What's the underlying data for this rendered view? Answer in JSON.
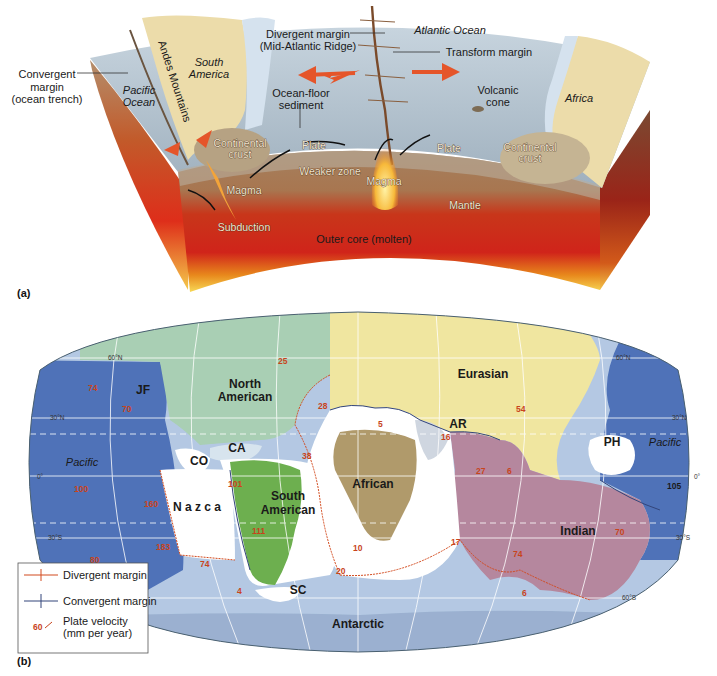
{
  "panel_a": {
    "tag": "(a)",
    "labels": {
      "convergent_margin": [
        "Convergent",
        "margin",
        "(ocean trench)"
      ],
      "pacific_ocean": [
        "Pacific",
        "Ocean"
      ],
      "andes": "Andes Mountains",
      "south_america": [
        "South",
        "America"
      ],
      "divergent_margin": [
        "Divergent margin",
        "(Mid-Atlantic Ridge)"
      ],
      "atlantic_ocean": "Atlantic Ocean",
      "transform_margin": "Transform margin",
      "ocean_floor_sediment": [
        "Ocean-floor",
        "sediment"
      ],
      "volcanic_cone": [
        "Volcanic",
        "cone"
      ],
      "africa": "Africa",
      "continental_crust_left": [
        "Continental",
        "crust"
      ],
      "continental_crust_right": [
        "Continental",
        "crust"
      ],
      "plate_left": "Plate",
      "plate_right": "Plate",
      "weaker_zone": "Weaker zone",
      "magma_left": "Magma",
      "magma_center": "Magma",
      "mantle": "Mantle",
      "subduction": "Subduction",
      "outer_core": "Outer core (molten)"
    }
  },
  "panel_b": {
    "tag": "(b)",
    "plates": {
      "north_american": [
        "North",
        "American"
      ],
      "eurasian": "Eurasian",
      "pacific_left": "Pacific",
      "pacific_right": "Pacific",
      "juan_de_fuca": "JF",
      "cocos": "CO",
      "caribbean": "CA",
      "nazca": "N a z c a",
      "south_american": [
        "South",
        "American"
      ],
      "african": "African",
      "arabian": "AR",
      "philippine": "PH",
      "indian": "Indian",
      "scotia": "SC",
      "antarctic": "Antarctic"
    },
    "latitudes": {
      "n60_left": "60°N",
      "n30_left": "30°N",
      "eq_left": "0°",
      "s30_left": "30°S",
      "n60_right": "60°N",
      "n30_right": "30°N",
      "eq_right": "0°",
      "s30_right": "30°S",
      "s60_right": "60°S"
    },
    "velocities": {
      "v74a": "74",
      "v70a": "70",
      "v25": "25",
      "v28": "28",
      "v38": "38",
      "v100": "100",
      "v101": "101",
      "v160": "160",
      "v111": "111",
      "v183": "183",
      "v80": "80",
      "v74b": "74",
      "v4": "4",
      "v20": "20",
      "v10": "10",
      "v5": "5",
      "v16": "16",
      "v54": "54",
      "v27": "27",
      "v6a": "6",
      "v17": "17",
      "v74c": "74",
      "v6b": "6",
      "v70b": "70",
      "v105": "105"
    },
    "legend": {
      "divergent": "Divergent margin",
      "convergent": "Convergent margin",
      "velocity_sample": "60",
      "velocity": [
        "Plate velocity",
        "(mm per year)"
      ]
    }
  },
  "colors": {
    "ocean_plate_blue": "#4f72b8",
    "north_american": "#a9cfb4",
    "eurasian": "#f1e6a0",
    "south_american": "#6db04f",
    "african": "#b19a6c",
    "indian": "#b6889e",
    "antarctic": "#b4c9e3",
    "divergent_red": "#d24a1e",
    "convergent_blue": "#33457a"
  }
}
